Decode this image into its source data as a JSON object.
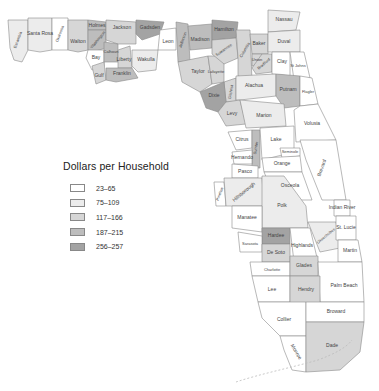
{
  "legend": {
    "title": "Dollars per Household",
    "classes": [
      {
        "label": "23–65",
        "color": "#ffffff"
      },
      {
        "label": "75–109",
        "color": "#ececec"
      },
      {
        "label": "117–166",
        "color": "#d6d6d6"
      },
      {
        "label": "187–215",
        "color": "#bdbdbd"
      },
      {
        "label": "256–257",
        "color": "#a3a3a3"
      }
    ]
  },
  "counties": [
    {
      "name": "Escambia",
      "class": 1
    },
    {
      "name": "Santa Rosa",
      "class": 1
    },
    {
      "name": "Okaloosa",
      "class": 0
    },
    {
      "name": "Walton",
      "class": 2
    },
    {
      "name": "Holmes",
      "class": 3
    },
    {
      "name": "Washington",
      "class": 3
    },
    {
      "name": "Jackson",
      "class": 2
    },
    {
      "name": "Bay",
      "class": 0
    },
    {
      "name": "Calhoun",
      "class": 3
    },
    {
      "name": "Gulf",
      "class": 2
    },
    {
      "name": "Liberty",
      "class": 2
    },
    {
      "name": "Franklin",
      "class": 3
    },
    {
      "name": "Gadsden",
      "class": 4
    },
    {
      "name": "Leon",
      "class": 0
    },
    {
      "name": "Wakulla",
      "class": 1
    },
    {
      "name": "Jefferson",
      "class": 3
    },
    {
      "name": "Madison",
      "class": 3
    },
    {
      "name": "Hamilton",
      "class": 4
    },
    {
      "name": "Taylor",
      "class": 2
    },
    {
      "name": "Lafayette",
      "class": 2
    },
    {
      "name": "Suwannee",
      "class": 2
    },
    {
      "name": "Columbia",
      "class": 2
    },
    {
      "name": "Baker",
      "class": 2
    },
    {
      "name": "Nassau",
      "class": 1
    },
    {
      "name": "Duval",
      "class": 1
    },
    {
      "name": "Union",
      "class": 2
    },
    {
      "name": "Bradford",
      "class": 2
    },
    {
      "name": "Clay",
      "class": 0
    },
    {
      "name": "St Johns",
      "class": 0
    },
    {
      "name": "Gilchrist",
      "class": 2
    },
    {
      "name": "Dixie",
      "class": 4
    },
    {
      "name": "Alachua",
      "class": 1
    },
    {
      "name": "Putnam",
      "class": 3
    },
    {
      "name": "Flagler",
      "class": 0
    },
    {
      "name": "Levy",
      "class": 2
    },
    {
      "name": "Marion",
      "class": 1
    },
    {
      "name": "Volusia",
      "class": 0
    },
    {
      "name": "Citrus",
      "class": 0
    },
    {
      "name": "Sumter",
      "class": 3
    },
    {
      "name": "Lake",
      "class": 0
    },
    {
      "name": "Seminole",
      "class": 0
    },
    {
      "name": "Hernando",
      "class": 0
    },
    {
      "name": "Pasco",
      "class": 0
    },
    {
      "name": "Orange",
      "class": 0
    },
    {
      "name": "Brevard",
      "class": 0
    },
    {
      "name": "Osceola",
      "class": 0
    },
    {
      "name": "Pinellas",
      "class": 0
    },
    {
      "name": "Hillsborough",
      "class": 1
    },
    {
      "name": "Polk",
      "class": 1
    },
    {
      "name": "Manatee",
      "class": 0
    },
    {
      "name": "Hardee",
      "class": 4
    },
    {
      "name": "Highlands",
      "class": 0
    },
    {
      "name": "Okeechobee",
      "class": 1
    },
    {
      "name": "Indian River",
      "class": 0
    },
    {
      "name": "St. Lucie",
      "class": 0
    },
    {
      "name": "Sarasota",
      "class": 0
    },
    {
      "name": "De Soto",
      "class": 2
    },
    {
      "name": "Martin",
      "class": 0
    },
    {
      "name": "Charlotte",
      "class": 0
    },
    {
      "name": "Glades",
      "class": 2
    },
    {
      "name": "Palm Beach",
      "class": 0
    },
    {
      "name": "Lee",
      "class": 0
    },
    {
      "name": "Hendry",
      "class": 2
    },
    {
      "name": "Collier",
      "class": 0
    },
    {
      "name": "Broward",
      "class": 0
    },
    {
      "name": "Monroe",
      "class": 0
    },
    {
      "name": "Dade",
      "class": 2
    }
  ],
  "keys_label": "Florida Keys"
}
